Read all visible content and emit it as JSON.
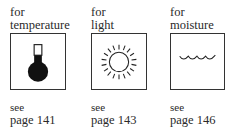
{
  "items": [
    {
      "for": "for",
      "label": "temperature",
      "icon": "thermometer-icon",
      "see": "see",
      "page": "page 141"
    },
    {
      "for": "for",
      "label": "light",
      "icon": "sun-icon",
      "see": "see",
      "page": "page 143"
    },
    {
      "for": "for",
      "label": "moisture",
      "icon": "water-wave-icon",
      "see": "see",
      "page": "page 146"
    }
  ]
}
